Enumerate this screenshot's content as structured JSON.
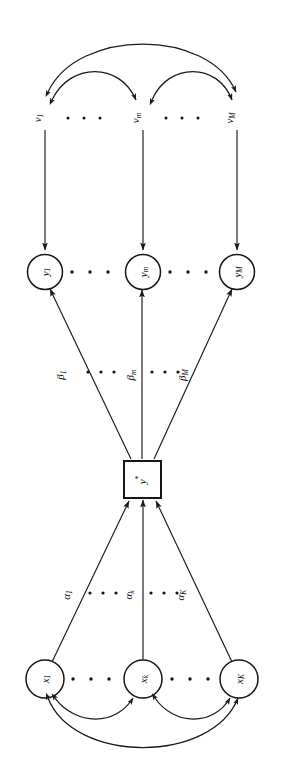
{
  "figure": {
    "caption": "Figure 4.  Expression of an unobservable variable as an exact function.",
    "rotation_degrees": 90,
    "ink_color": "#151515",
    "background_color": "#ffffff"
  },
  "diagram": {
    "type": "path-diagram",
    "disturbance_row": {
      "label": "v",
      "nodes": [
        {
          "id": "v1",
          "base": "v",
          "subscript": "1"
        },
        {
          "id": "vm",
          "base": "v",
          "subscript": "m"
        },
        {
          "id": "vM",
          "base": "v",
          "subscript": "M"
        }
      ],
      "ellipsis": "· · ·"
    },
    "indicator_row": {
      "shape": "circle",
      "nodes": [
        {
          "id": "y1",
          "base": "y",
          "subscript": "1"
        },
        {
          "id": "ym",
          "base": "y",
          "subscript": "m"
        },
        {
          "id": "yM",
          "base": "y",
          "subscript": "M"
        }
      ],
      "ellipsis": "· · ·"
    },
    "latent_node": {
      "shape": "square",
      "base": "y",
      "superscript": "*"
    },
    "cause_row": {
      "shape": "circle",
      "nodes": [
        {
          "id": "x1",
          "base": "x",
          "subscript": "1"
        },
        {
          "id": "xk",
          "base": "x",
          "subscript": "k"
        },
        {
          "id": "xK",
          "base": "x",
          "subscript": "K"
        }
      ],
      "ellipsis": "· · ·"
    },
    "effect_coefficients": {
      "symbol": "β",
      "labels": [
        {
          "id": "beta1",
          "base": "β",
          "subscript": "1"
        },
        {
          "id": "betam",
          "base": "β",
          "subscript": "m"
        },
        {
          "id": "betaM",
          "base": "β",
          "subscript": "M"
        }
      ],
      "ellipsis": "· · ·"
    },
    "cause_coefficients": {
      "symbol": "α",
      "labels": [
        {
          "id": "alpha1",
          "base": "α",
          "subscript": "1"
        },
        {
          "id": "alphak",
          "base": "α",
          "subscript": "k"
        },
        {
          "id": "alphaK",
          "base": "α",
          "subscript": "K"
        }
      ],
      "ellipsis": "· · ·"
    },
    "correlation_arcs": {
      "count": 6,
      "style": "double-headed-curved",
      "groups": [
        "v-row",
        "x-row"
      ]
    }
  }
}
